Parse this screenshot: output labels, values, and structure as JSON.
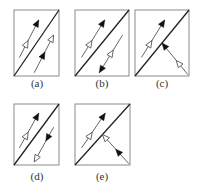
{
  "colors": {
    "frame": "#8a8a8a",
    "interface": "#222222",
    "ray": "#555555",
    "filled_head": "#111111",
    "open_head_stroke": "#555555",
    "open_head_fill": "#ffffff",
    "label": "#333333"
  },
  "panels": [
    {
      "label": "(a)",
      "upper_ray": {
        "direction": "up-right",
        "open_marker": "start",
        "filled_marker": "end"
      },
      "lower_ray": {
        "direction": "up-right",
        "open_marker": "end",
        "filled_marker": "start"
      }
    },
    {
      "label": "(b)",
      "upper_ray": {
        "direction": "up-right",
        "open_marker": "start",
        "filled_marker": "end"
      },
      "lower_ray": {
        "direction": "down-left",
        "open_marker": "start",
        "filled_marker": "end"
      }
    },
    {
      "label": "(c)",
      "upper_ray": {
        "direction": "up-right",
        "open_marker": "start",
        "filled_marker": "end"
      },
      "lower_ray": {
        "direction": "up-left",
        "open_marker": "start",
        "filled_marker": "end",
        "touches_interface": true
      }
    },
    {
      "label": "(d)",
      "upper_ray": {
        "direction": "up-right",
        "open_marker": "start",
        "filled_marker": "end"
      },
      "lower_ray": {
        "direction": "down-left",
        "open_marker": "end",
        "filled_marker": "start"
      }
    },
    {
      "label": "(e)",
      "upper_ray": {
        "direction": "up-right",
        "open_marker": "start",
        "filled_marker": "end"
      },
      "lower_ray": {
        "direction": "up-left",
        "open_marker": "end",
        "filled_marker": "start",
        "touches_interface": true
      }
    }
  ]
}
